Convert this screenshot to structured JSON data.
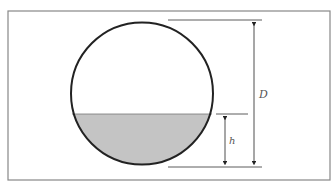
{
  "diagram": {
    "labels": {
      "diameter": "D",
      "depth": "h"
    },
    "colors": {
      "frame": "#888888",
      "outline": "#222222",
      "fill": "#c4c4c4",
      "dimension": "#333333"
    }
  }
}
